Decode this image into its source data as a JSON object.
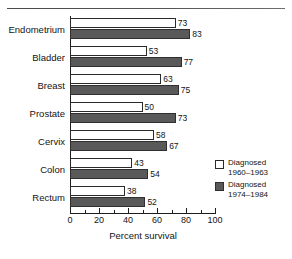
{
  "chart_data": {
    "type": "bar",
    "orientation": "horizontal",
    "title": "",
    "xlabel": "Percent survival",
    "ylabel": "",
    "xlim": [
      0,
      100
    ],
    "xticks": [
      0,
      20,
      40,
      60,
      80,
      100
    ],
    "xtick_labels": [
      "0",
      "20",
      "40",
      "60",
      "80",
      "100"
    ],
    "minor_xticks": [
      10,
      30,
      50,
      70,
      90
    ],
    "grid": false,
    "legend_position": "lower-right",
    "categories": [
      "Endometrium",
      "Bladder",
      "Breast",
      "Prostate",
      "Cervix",
      "Colon",
      "Rectum"
    ],
    "series": [
      {
        "name": "Diagnosed 1960-1963",
        "name_line1": "Diagnosed",
        "name_line2": "1960–1963",
        "color": "#ffffff",
        "values": [
          73,
          53,
          63,
          50,
          58,
          43,
          38
        ]
      },
      {
        "name": "Diagnosed 1974-1984",
        "name_line1": "Diagnosed",
        "name_line2": "1974–1984",
        "color": "#595959",
        "values": [
          83,
          77,
          75,
          73,
          67,
          54,
          52
        ]
      }
    ]
  },
  "colors": {
    "series_0": "#ffffff",
    "series_1": "#595959",
    "axis": "#1d1d1d",
    "text": "#141414"
  }
}
